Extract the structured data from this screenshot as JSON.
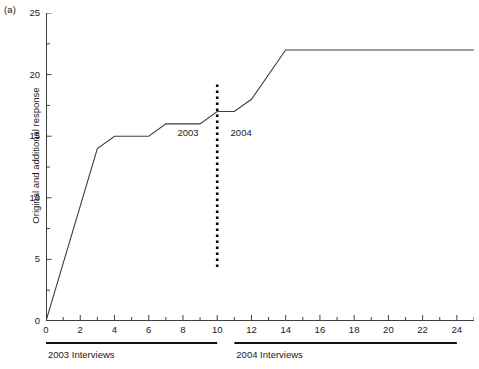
{
  "figure": {
    "panel_label": "(a)"
  },
  "chart_data": {
    "type": "line",
    "title": "",
    "subtitle": "",
    "panel": "(a)",
    "xlabel": "",
    "ylabel": "Original and additional response",
    "xlim": [
      0,
      25
    ],
    "ylim": [
      0,
      25
    ],
    "grid": false,
    "legend": "none",
    "x_ticks": [
      0,
      2,
      4,
      6,
      8,
      10,
      12,
      14,
      16,
      18,
      20,
      22,
      24
    ],
    "x_tick_labels": [
      "0",
      "2",
      "4",
      "6",
      "8",
      "10",
      "12",
      "14",
      "16",
      "18",
      "20",
      "22",
      "24"
    ],
    "x_minor_tick_interval": 1,
    "y_ticks": [
      0,
      5,
      10,
      15,
      20,
      25
    ],
    "y_tick_labels": [
      "0",
      "5",
      "10",
      "15",
      "20",
      "25"
    ],
    "y_minor_tick_interval": 2.5,
    "series": [
      {
        "name": "Original and additional response",
        "color": "#3f3f3f",
        "points": [
          {
            "x": 0,
            "y": 0
          },
          {
            "x": 3,
            "y": 14
          },
          {
            "x": 4,
            "y": 15
          },
          {
            "x": 6,
            "y": 15
          },
          {
            "x": 7,
            "y": 16
          },
          {
            "x": 9,
            "y": 16
          },
          {
            "x": 10,
            "y": 17
          },
          {
            "x": 11,
            "y": 17
          },
          {
            "x": 12,
            "y": 18
          },
          {
            "x": 14,
            "y": 22
          },
          {
            "x": 25,
            "y": 22
          }
        ]
      }
    ],
    "annotations": [
      {
        "name": "year-divider",
        "type": "vertical-dashed-line",
        "x": 10,
        "y_start": 4.2,
        "y_end": 19.2,
        "color": "#000000"
      },
      {
        "name": "era-label-2003",
        "type": "text",
        "text": "2003",
        "x": 8.5,
        "y": 15.3
      },
      {
        "name": "era-label-2004",
        "type": "text",
        "text": "2004",
        "x": 11.6,
        "y": 15.3
      }
    ],
    "groups": [
      {
        "label": "2003 Interviews",
        "x_start": 0,
        "x_end": 10
      },
      {
        "label": "2004 Interviews",
        "x_start": 11,
        "x_end": 24
      }
    ]
  },
  "axes": {
    "y_title": "Original and additional response",
    "y_labels": [
      "25",
      "20",
      "15",
      "10",
      "5",
      "0"
    ],
    "x_labels": [
      "0",
      "2",
      "4",
      "6",
      "8",
      "10",
      "12",
      "14",
      "16",
      "18",
      "20",
      "22",
      "24"
    ]
  },
  "era_labels": {
    "left": "2003",
    "right": "2004"
  },
  "groups": {
    "left_caption": "2003 Interviews",
    "right_caption": "2004 Interviews"
  },
  "colors": {
    "line": "#3f3f3f",
    "axis": "#3f3f3f",
    "divider": "#000000",
    "text": "#1a1a1a",
    "background": "#ffffff"
  }
}
